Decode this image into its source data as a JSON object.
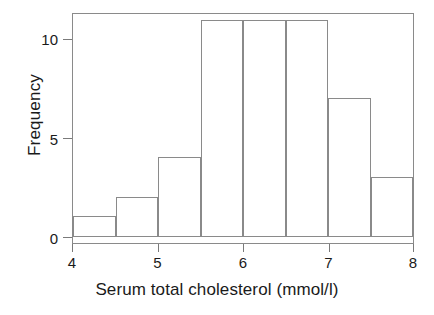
{
  "chart_data": {
    "type": "bar",
    "title": "",
    "subtitle": "",
    "xlabel": "Serum total cholesterol (mmol/l)",
    "ylabel": "Frequency",
    "categories": [
      "4.0-4.5",
      "4.5-5.0",
      "5.0-5.5",
      "5.5-6.0",
      "6.0-6.5",
      "6.5-7.0",
      "7.0-7.5",
      "7.5-8.0"
    ],
    "bin_edges": [
      4.0,
      4.5,
      5.0,
      5.5,
      6.0,
      6.5,
      7.0,
      7.5,
      8.0
    ],
    "bin_width": 0.5,
    "values": [
      1,
      2,
      4,
      11,
      11,
      11,
      7,
      3
    ],
    "xlim": [
      4,
      8
    ],
    "ylim": [
      0,
      11.3
    ],
    "xticks": [
      "4",
      "5",
      "6",
      "7",
      "8"
    ],
    "xtick_values": [
      4,
      5,
      6,
      7,
      8
    ],
    "yticks": [
      "0",
      "5",
      "10"
    ],
    "ytick_values": [
      0,
      5,
      10
    ],
    "grid": false,
    "legend": false,
    "legend_position": "none",
    "bar_fill_color": "#ffffff",
    "bar_edge_color": "#8a8a8a",
    "axis_color": "#8a8a8a",
    "text_color": "#1a1a1a",
    "background_color": "#ffffff"
  }
}
